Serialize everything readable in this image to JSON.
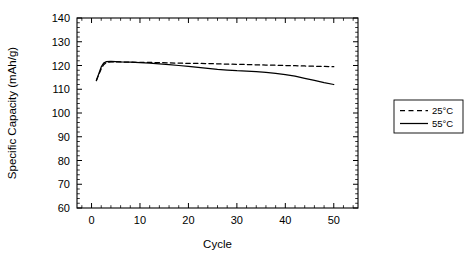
{
  "chart_data": {
    "type": "line",
    "title": "",
    "xlabel": "Cycle",
    "ylabel": "Specific Capacity (mAh/g)",
    "xlim": [
      -3,
      55
    ],
    "ylim": [
      60,
      140
    ],
    "xticks": [
      0,
      10,
      20,
      30,
      40,
      50
    ],
    "xtick_labels": [
      "0",
      "10",
      "20",
      "30",
      "40",
      "50"
    ],
    "xtick_minor_step": 2,
    "yticks": [
      60,
      70,
      80,
      90,
      100,
      110,
      120,
      130,
      140
    ],
    "ytick_labels": [
      "60",
      "70",
      "80",
      "90",
      "100",
      "110",
      "120",
      "130",
      "140"
    ],
    "ytick_minor_step": 2,
    "grid": false,
    "legend_position": "right-outside",
    "series": [
      {
        "name": "25°C",
        "style": "dashed",
        "color": "#000000",
        "x": [
          1,
          1.5,
          2,
          2.5,
          3,
          4,
          5,
          6,
          8,
          10,
          12,
          14,
          16,
          18,
          20,
          22,
          24,
          26,
          28,
          30,
          32,
          34,
          36,
          38,
          40,
          42,
          44,
          46,
          48,
          50
        ],
        "y": [
          113.8,
          116.2,
          118.6,
          120.3,
          121.2,
          121.5,
          121.5,
          121.5,
          121.4,
          121.3,
          121.3,
          121.2,
          121.1,
          121.0,
          120.9,
          120.9,
          120.8,
          120.7,
          120.6,
          120.5,
          120.4,
          120.3,
          120.2,
          120.1,
          120.0,
          119.9,
          119.8,
          119.7,
          119.6,
          119.5
        ]
      },
      {
        "name": "55°C",
        "style": "solid",
        "color": "#000000",
        "x": [
          1,
          1.5,
          2,
          2.5,
          3,
          4,
          5,
          6,
          8,
          10,
          12,
          14,
          16,
          18,
          20,
          22,
          24,
          26,
          28,
          30,
          32,
          34,
          36,
          38,
          40,
          42,
          44,
          46,
          48,
          50
        ],
        "y": [
          113.6,
          116.5,
          119.4,
          121.0,
          121.6,
          121.7,
          121.6,
          121.5,
          121.4,
          121.2,
          121.0,
          120.7,
          120.4,
          120.0,
          119.6,
          119.2,
          118.8,
          118.4,
          118.1,
          117.8,
          117.6,
          117.4,
          117.1,
          116.7,
          116.2,
          115.5,
          114.6,
          113.7,
          112.8,
          112.0
        ]
      }
    ]
  },
  "legend": {
    "entries": [
      {
        "label": "25°C",
        "style": "dashed"
      },
      {
        "label": "55°C",
        "style": "solid"
      }
    ]
  }
}
